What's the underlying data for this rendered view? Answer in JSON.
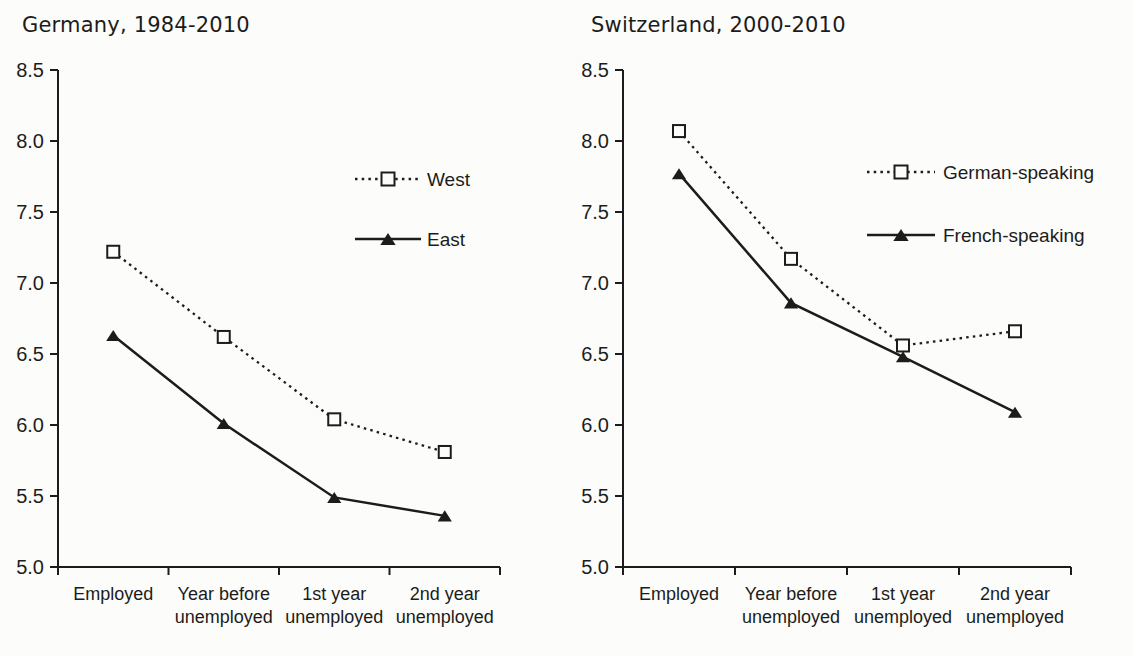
{
  "figure": {
    "background": "#fcfcfa",
    "ink_color": "#1c1c1c",
    "marker_fill": "#fcfcfa"
  },
  "chart_data": [
    {
      "type": "line",
      "title": "Germany, 1984-2010",
      "categories": [
        [
          "Employed"
        ],
        [
          "Year before",
          "unemployed"
        ],
        [
          "1st year",
          "unemployed"
        ],
        [
          "2nd year",
          "unemployed"
        ]
      ],
      "series": [
        {
          "name": "West",
          "line_style": "dotted",
          "marker": "open-square",
          "values": [
            7.22,
            6.62,
            6.04,
            5.81
          ]
        },
        {
          "name": "East",
          "line_style": "solid",
          "marker": "filled-triangle",
          "values": [
            6.63,
            6.01,
            5.49,
            5.36
          ]
        }
      ],
      "ylim": [
        5.0,
        8.5
      ],
      "ytick_step": 0.5,
      "grid": false,
      "legend_position": "inside right"
    },
    {
      "type": "line",
      "title": "Switzerland, 2000-2010",
      "categories": [
        [
          "Employed"
        ],
        [
          "Year before",
          "unemployed"
        ],
        [
          "1st year",
          "unemployed"
        ],
        [
          "2nd year",
          "unemployed"
        ]
      ],
      "series": [
        {
          "name": "German-speaking",
          "line_style": "dotted",
          "marker": "open-square",
          "values": [
            8.07,
            7.17,
            6.56,
            6.66
          ]
        },
        {
          "name": "French-speaking",
          "line_style": "solid",
          "marker": "filled-triangle",
          "values": [
            7.77,
            6.86,
            6.48,
            6.09
          ]
        }
      ],
      "ylim": [
        5.0,
        8.5
      ],
      "ytick_step": 0.5,
      "grid": false,
      "legend_position": "inside right"
    }
  ]
}
